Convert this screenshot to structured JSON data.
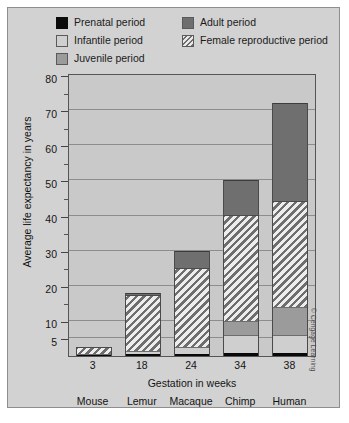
{
  "legend": {
    "left_column": [
      {
        "label": "Prenatal period",
        "swatch": "prenatal-swatch",
        "color": "#0b0b0b"
      },
      {
        "label": "Infantile period",
        "swatch": "infantile-swatch",
        "color": "#cfcfcf"
      },
      {
        "label": "Juvenile period",
        "swatch": "juvenile-swatch",
        "color": "#9b9b9b"
      }
    ],
    "right_column": [
      {
        "label": "Adult period",
        "swatch": "adult-swatch",
        "color": "#6f6f6f"
      },
      {
        "label": "Female reproductive period",
        "swatch": "female-reproductive-swatch",
        "color": "#6e6e6e"
      }
    ]
  },
  "credit": "© Cengage Learning",
  "chart_data": {
    "type": "bar",
    "subtype": "stacked",
    "title": "",
    "xlabel": "Gestation in weeks",
    "ylabel": "Average life expectancy in years",
    "ylim": [
      0,
      80
    ],
    "ytick_labels": [
      "5",
      "10",
      "20",
      "30",
      "40",
      "50",
      "60",
      "70",
      "80"
    ],
    "ytick_values": [
      5,
      10,
      20,
      30,
      40,
      50,
      60,
      70,
      80
    ],
    "yminor_values": [
      15,
      25,
      35,
      45,
      55,
      65,
      75
    ],
    "grid": true,
    "legend_position": "top",
    "categories": [
      "Mouse",
      "Lemur",
      "Macaque",
      "Chimp",
      "Human"
    ],
    "x": [
      3,
      18,
      24,
      34,
      38
    ],
    "x_tick_labels": [
      "3",
      "18",
      "24",
      "34",
      "38"
    ],
    "series": [
      {
        "name": "Prenatal period",
        "color": "#090909",
        "values": [
          0.3,
          0.45,
          0.7,
          0.85,
          0.9
        ]
      },
      {
        "name": "Infantile period",
        "color": "#cfcfcf",
        "values": [
          0.2,
          0.9,
          1.8,
          5.2,
          5.1
        ]
      },
      {
        "name": "Juvenile period",
        "color": "#9b9b9b",
        "values": [
          0,
          0,
          0,
          4.0,
          8.0
        ]
      },
      {
        "name": "Female reproductive period",
        "color": "#6e6e6e",
        "values": [
          2.0,
          16.1,
          22.5,
          30.0,
          30.0
        ]
      },
      {
        "name": "Adult period",
        "color": "#6f6f6f",
        "values": [
          0,
          0.55,
          5.0,
          10.0,
          28.0
        ]
      }
    ],
    "totals": [
      2.5,
      18,
      30,
      50,
      72
    ],
    "annotations": []
  }
}
